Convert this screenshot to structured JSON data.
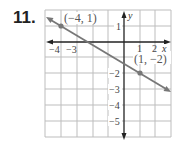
{
  "problem": {
    "number": "11."
  },
  "graph": {
    "x_axis_label": "x",
    "y_axis_label": "y",
    "x_tick_labels": [
      {
        "value": -4,
        "label": "−4"
      },
      {
        "value": -3,
        "label": "−3"
      },
      {
        "value": 1,
        "label": "1"
      },
      {
        "value": 2,
        "label": "2"
      }
    ],
    "y_tick_labels": [
      {
        "value": 1,
        "label": "1"
      },
      {
        "value": -2,
        "label": "−2"
      },
      {
        "value": -3,
        "label": "−3"
      },
      {
        "value": -4,
        "label": "−4"
      },
      {
        "value": -5,
        "label": "−5"
      }
    ],
    "points": [
      {
        "x": -4,
        "y": 1,
        "label": "(−4, 1)"
      },
      {
        "x": 1,
        "y": -2,
        "label": "(1, −2)"
      }
    ],
    "line_color": "#777777",
    "axis_color": "#222222",
    "grid_color": "#bdbdbd"
  }
}
